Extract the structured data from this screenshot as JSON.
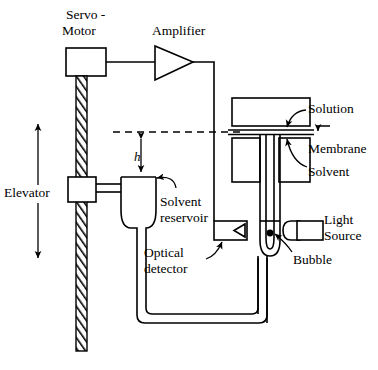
{
  "figure": {
    "type": "technical-diagram",
    "background_color": "#ffffff",
    "line_color": "#000000",
    "width": 378,
    "height": 370
  },
  "labels": {
    "servo_motor_line1": "Servo -",
    "servo_motor_line2": "Motor",
    "amplifier": "Amplifier",
    "elevator": "Elevator",
    "height_symbol": "h",
    "solvent_reservoir_line1": "Solvent",
    "solvent_reservoir_line2": "reservoir",
    "optical_detector_line1": "Optical",
    "optical_detector_line2": "detector",
    "solution": "Solution",
    "membrane": "Membrane",
    "solvent": "Solvent",
    "light_source_line1": "Light",
    "light_source_line2": "Source",
    "bubble": "Bubble"
  },
  "components": [
    {
      "name": "servo-motor",
      "label": "Servo - Motor",
      "shape": "rectangle"
    },
    {
      "name": "amplifier",
      "label": "Amplifier",
      "shape": "triangle"
    },
    {
      "name": "threaded-rod",
      "label": "",
      "shape": "hatched-column"
    },
    {
      "name": "elevator-carriage",
      "label": "Elevator",
      "shape": "rectangle"
    },
    {
      "name": "solvent-reservoir",
      "label": "Solvent reservoir",
      "shape": "u-vessel"
    },
    {
      "name": "optical-detector",
      "label": "Optical detector",
      "shape": "rectangle-with-notch"
    },
    {
      "name": "measurement-cell",
      "label": "Solution / Membrane / Solvent",
      "shape": "stacked-chambers"
    },
    {
      "name": "capillary-u-tube",
      "label": "",
      "shape": "u-tube"
    },
    {
      "name": "light-source",
      "label": "Light Source",
      "shape": "capsule"
    },
    {
      "name": "bubble",
      "label": "Bubble",
      "shape": "dot"
    },
    {
      "name": "height-dimension",
      "label": "h",
      "shape": "double-arrow"
    },
    {
      "name": "elevator-travel-arrow",
      "label": "Elevator",
      "shape": "double-arrow"
    },
    {
      "name": "reference-level",
      "label": "",
      "shape": "dashed-line"
    }
  ]
}
